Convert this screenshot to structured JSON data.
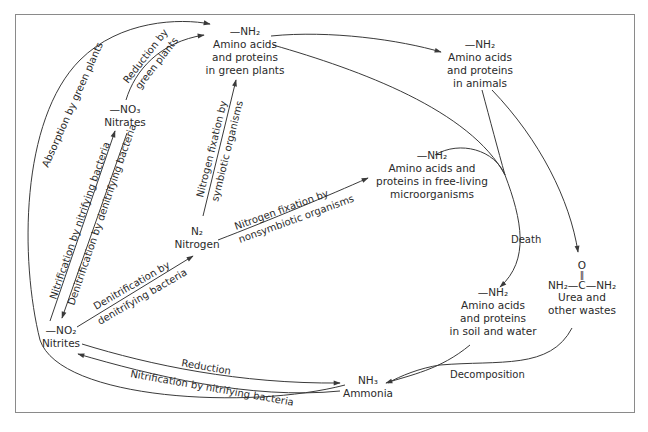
{
  "diagram": {
    "nodes": {
      "plants": {
        "formula": "—NH₂",
        "lines": [
          "Amino acids",
          "and proteins",
          "in green plants"
        ]
      },
      "animals": {
        "formula": "—NH₂",
        "lines": [
          "Amino acids",
          "and proteins",
          "in animals"
        ]
      },
      "nitrates": {
        "formula": "—NO₃",
        "lines": [
          "Nitrates"
        ]
      },
      "nitrogen": {
        "formula": "N₂",
        "lines": [
          "Nitrogen"
        ]
      },
      "microorganisms": {
        "formula": "—NH₂",
        "lines": [
          "Amino acids and",
          "proteins in free-living",
          "microorganisms"
        ]
      },
      "soil": {
        "formula": "—NH₂",
        "lines": [
          "Amino acids",
          "and proteins",
          "in soil and water"
        ]
      },
      "urea": {
        "formula_top": "O",
        "formula_bond": "‖",
        "formula": "NH₂—C—NH₂",
        "lines": [
          "Urea and",
          "other wastes"
        ]
      },
      "nitrites": {
        "formula": "—NO₂",
        "lines": [
          "Nitrites"
        ]
      },
      "ammonia": {
        "formula": "NH₃",
        "lines": [
          "Ammonia"
        ]
      }
    },
    "edge_labels": {
      "absorption": "Absorption by green plants",
      "reduction_green_1": "Reduction by",
      "reduction_green_2": "green plants",
      "nitrification_no3": "Nitrification by nitrifying bacteria",
      "denitrification_no3": "Denitrification by denitrifying bacteria",
      "fixation_symbiotic_1": "Nitrogen fixation by",
      "fixation_symbiotic_2": "symbiotic organisms",
      "fixation_nonsymbiotic_1": "Nitrogen fixation by",
      "fixation_nonsymbiotic_2": "nonsymbiotic organisms",
      "denitrification_no2_1": "Denitrification by",
      "denitrification_no2_2": "denitrifying bacteria",
      "death": "Death",
      "decomposition": "Decomposition",
      "reduction": "Reduction",
      "nitrification_nh3": "Nitrification by nitrifying bacteria"
    },
    "colors": {
      "line": "#3a3a3a",
      "text": "#2a2a2a",
      "frame": "#8a8a8a",
      "background": "#ffffff"
    }
  }
}
